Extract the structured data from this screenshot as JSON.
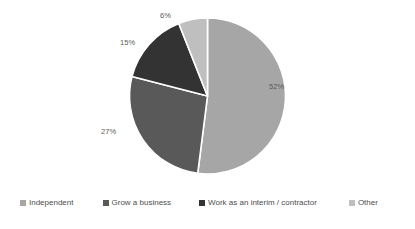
{
  "chart_data": {
    "type": "pie",
    "title": "",
    "subtitle": "",
    "xlabel": "",
    "ylabel": "",
    "grid": false,
    "legend_position": "bottom",
    "start_angle_deg": 0,
    "direction": "clockwise",
    "categories": [
      "Independent",
      "Grow a business",
      "Work as an interim / contractor",
      "Other"
    ],
    "values": [
      52,
      27,
      15,
      6
    ],
    "value_unit": "%",
    "data_labels": [
      "52%",
      "27%",
      "15%",
      "6%"
    ],
    "colors": [
      "#a6a6a6",
      "#595959",
      "#333333",
      "#bfbfbf"
    ],
    "slices": [
      {
        "label": "Independent",
        "value": 52,
        "display": "52%",
        "color": "#a6a6a6"
      },
      {
        "label": "Grow a business",
        "value": 27,
        "display": "27%",
        "color": "#595959"
      },
      {
        "label": "Work as an interim / contractor",
        "value": 15,
        "display": "15%",
        "color": "#333333"
      },
      {
        "label": "Other",
        "value": 6,
        "display": "6%",
        "color": "#bfbfbf"
      }
    ]
  },
  "legend": {
    "items": [
      {
        "label": "Independent",
        "color": "#a6a6a6"
      },
      {
        "label": "Grow a business",
        "color": "#595959"
      },
      {
        "label": "Work as an interim / contractor",
        "color": "#333333"
      },
      {
        "label": "Other",
        "color": "#bfbfbf"
      }
    ]
  },
  "labels": {
    "slice_0": "52%",
    "slice_1": "27%",
    "slice_2": "15%",
    "slice_3": "6%"
  },
  "style": {
    "background": "#ffffff",
    "label_color": "#595959",
    "legend_text_color": "#4d4d4d",
    "slice_border": "#ffffff"
  }
}
